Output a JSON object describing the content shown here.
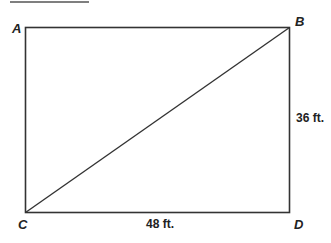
{
  "diagram": {
    "title_rule": {
      "present": true
    },
    "shape": "rectangle with diagonal",
    "vertices": {
      "A": "A",
      "B": "B",
      "C": "C",
      "D": "D"
    },
    "dimensions": {
      "height_label": "36 ft.",
      "width_label": "48 ft."
    },
    "diagonal": "C to B",
    "colors": {
      "stroke": "#333333",
      "background": "#ffffff"
    }
  }
}
